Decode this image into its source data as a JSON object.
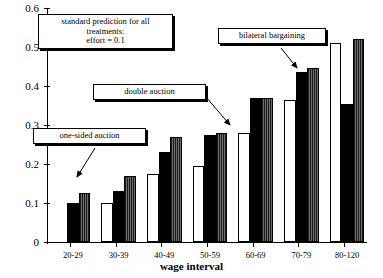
{
  "chart_data": {
    "type": "bar",
    "title": "",
    "xlabel": "wage interval",
    "ylabel": "",
    "ylim": [
      0,
      0.6
    ],
    "ytick_labels": [
      "0",
      "0.1",
      "0.2",
      "0.3",
      "0.4",
      "0.5",
      "0.6"
    ],
    "ytick_values": [
      0,
      0.1,
      0.2,
      0.3,
      0.4,
      0.5,
      0.6
    ],
    "grid": false,
    "legend_position": "annotations",
    "categories": [
      "20-29",
      "30-39",
      "40-49",
      "50-59",
      "60-69",
      "70-79",
      "80-120"
    ],
    "series": [
      {
        "name": "one-sided auction",
        "style": "white",
        "values": [
          0.0,
          0.1,
          0.175,
          0.195,
          0.28,
          0.365,
          0.51
        ]
      },
      {
        "name": "double auction",
        "style": "black",
        "values": [
          0.1,
          0.13,
          0.23,
          0.275,
          0.37,
          0.435,
          0.355
        ]
      },
      {
        "name": "bilateral bargaining",
        "style": "hatch",
        "values": [
          0.125,
          0.17,
          0.27,
          0.28,
          0.37,
          0.445,
          0.52
        ]
      }
    ],
    "annotations": [
      {
        "id": "standard-prediction",
        "lines": [
          "standard prediction for all",
          "treatments:",
          "effort = 0.1"
        ]
      },
      {
        "id": "double-auction",
        "lines": [
          "double auction"
        ]
      },
      {
        "id": "one-sided-auction",
        "lines": [
          "one-sided auction"
        ]
      },
      {
        "id": "bilateral-bargaining",
        "lines": [
          "bilateral bargaining"
        ]
      }
    ],
    "colors": {
      "white_bar": "#ffffff",
      "black_bar": "#000000",
      "hatch_bar": "#4a4a4a",
      "axis": "#000000"
    }
  }
}
